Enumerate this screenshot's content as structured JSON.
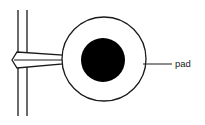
{
  "diagram": {
    "labels": {
      "pad": "pad"
    },
    "colors": {
      "stroke": "#1a1a1a",
      "fill": "#000000",
      "background": "#ffffff"
    },
    "elements": {
      "trace_lines": [
        {
          "x": 18,
          "y1": 10,
          "y2": 116
        },
        {
          "x": 27,
          "y1": 10,
          "y2": 116
        }
      ],
      "pad_outer": {
        "cx": 104,
        "cy": 59,
        "r": 42
      },
      "pad_hole": {
        "cx": 103,
        "cy": 60,
        "r": 22
      },
      "leader_line": {
        "x1": 143,
        "y1": 64,
        "x2": 172,
        "y2": 64
      }
    }
  }
}
